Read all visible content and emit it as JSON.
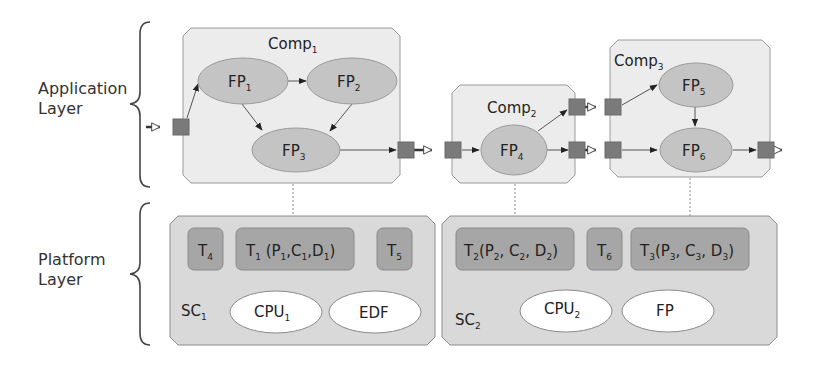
{
  "layers": {
    "application": {
      "line1": "Application",
      "line2": "Layer"
    },
    "platform": {
      "line1": "Platform",
      "line2": "Layer"
    }
  },
  "components": [
    {
      "id": "comp1",
      "base": "Comp",
      "sub": "1"
    },
    {
      "id": "comp2",
      "base": "Comp",
      "sub": "2"
    },
    {
      "id": "comp3",
      "base": "Comp",
      "sub": "3"
    }
  ],
  "function_points": [
    {
      "id": "fp1",
      "base": "FP",
      "sub": "1"
    },
    {
      "id": "fp2",
      "base": "FP",
      "sub": "2"
    },
    {
      "id": "fp3",
      "base": "FP",
      "sub": "3"
    },
    {
      "id": "fp4",
      "base": "FP",
      "sub": "4"
    },
    {
      "id": "fp5",
      "base": "FP",
      "sub": "5"
    },
    {
      "id": "fp6",
      "base": "FP",
      "sub": "6"
    }
  ],
  "schedulers": [
    {
      "id": "sc1",
      "base": "SC",
      "sub": "1",
      "tasks": [
        {
          "id": "t4",
          "label": "T",
          "sub": "4"
        },
        {
          "id": "t1",
          "label": "T",
          "sub": "1",
          "params": [
            {
              "b": "P",
              "s": "1"
            },
            {
              "b": "C",
              "s": "1"
            },
            {
              "b": "D",
              "s": "1"
            }
          ]
        },
        {
          "id": "t5",
          "label": "T",
          "sub": "5"
        }
      ],
      "resources": [
        {
          "id": "cpu1",
          "base": "CPU",
          "sub": "1"
        },
        {
          "id": "edf",
          "base": "EDF",
          "sub": ""
        }
      ]
    },
    {
      "id": "sc2",
      "base": "SC",
      "sub": "2",
      "tasks": [
        {
          "id": "t2",
          "label": "T",
          "sub": "2",
          "params": [
            {
              "b": "P",
              "s": "2"
            },
            {
              "b": "C",
              "s": "2"
            },
            {
              "b": "D",
              "s": "2"
            }
          ]
        },
        {
          "id": "t6",
          "label": "T",
          "sub": "6"
        },
        {
          "id": "t3",
          "label": "T",
          "sub": "3",
          "params": [
            {
              "b": "P",
              "s": "3"
            },
            {
              "b": "C",
              "s": "3"
            },
            {
              "b": "D",
              "s": "3"
            }
          ]
        }
      ],
      "resources": [
        {
          "id": "cpu2",
          "base": "CPU",
          "sub": "2"
        },
        {
          "id": "fp",
          "base": "FP",
          "sub": ""
        }
      ]
    }
  ],
  "colors": {
    "component_fill": "#ececec",
    "scheduler_fill": "#d9d9d9",
    "function_point_fill": "#c4c4c4",
    "task_fill": "#a6a6a6",
    "port_fill": "#7a7a7a",
    "resource_fill": "#ffffff"
  }
}
